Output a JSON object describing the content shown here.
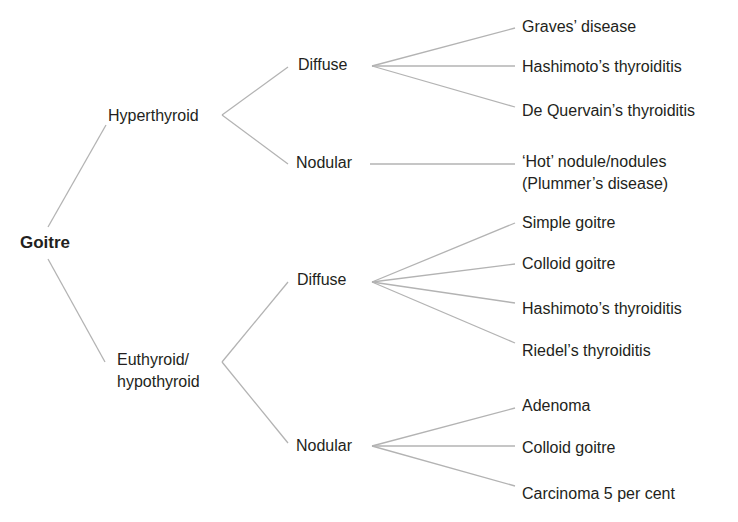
{
  "diagram": {
    "type": "tree",
    "root": "Goitre",
    "line_color": "#b3b3b3",
    "text_color": "#231f20",
    "level1": [
      {
        "label": "Hyperthyroid",
        "children": [
          {
            "label": "Diffuse",
            "children": [
              "Graves’ disease",
              "Hashimoto’s thyroiditis",
              "De Quervain’s thyroiditis"
            ]
          },
          {
            "label": "Nodular",
            "children": [
              "‘Hot’ nodule/nodules (Plummer’s disease)"
            ]
          }
        ]
      },
      {
        "label": "Euthyroid/ hypothyroid",
        "children": [
          {
            "label": "Diffuse",
            "children": [
              "Simple goitre",
              "Colloid goitre",
              "Hashimoto’s thyroiditis",
              "Riedel’s thyroiditis"
            ]
          },
          {
            "label": "Nodular",
            "children": [
              "Adenoma",
              "Colloid goitre",
              "Carcinoma 5 per cent"
            ]
          }
        ]
      }
    ]
  },
  "labels": {
    "root": "Goitre",
    "hyper": "Hyperthyroid",
    "hyper_diffuse": "Diffuse",
    "hyper_nodular": "Nodular",
    "hd1": "Graves’ disease",
    "hd2": "Hashimoto’s thyroiditis",
    "hd3": "De Quervain’s thyroiditis",
    "hn1_line1": "‘Hot’ nodule/nodules",
    "hn1_line2": "(Plummer’s disease)",
    "eu_line1": "Euthyroid/",
    "eu_line2": "hypothyroid",
    "eu_diffuse": "Diffuse",
    "eu_nodular": "Nodular",
    "ed1": "Simple goitre",
    "ed2": "Colloid goitre",
    "ed3": "Hashimoto’s thyroiditis",
    "ed4": "Riedel’s thyroiditis",
    "en1": "Adenoma",
    "en2": "Colloid goitre",
    "en3": "Carcinoma 5 per cent"
  }
}
